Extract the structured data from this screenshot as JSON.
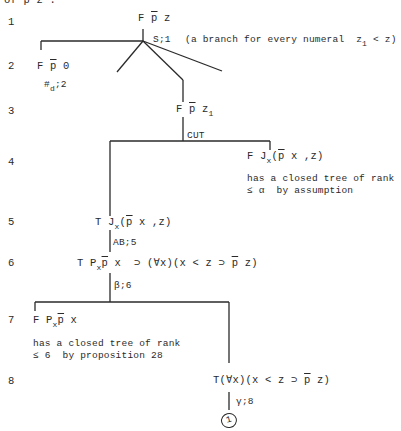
{
  "header_fragment": "of p z .",
  "line_numbers": [
    "1",
    "2",
    "3",
    "4",
    "5",
    "6",
    "7",
    "8"
  ],
  "nodes": {
    "n1": {
      "sign": "F",
      "pbar": "p",
      "rest": " z"
    },
    "rule1": "S;1",
    "rule1_note_pre": "(a branch for every numeral  z",
    "rule1_note_sub": "1",
    "rule1_note_post": " < z)",
    "n2": {
      "sign": "F ",
      "pbar": "p",
      "rest": " 0"
    },
    "rule2_pre": "#",
    "rule2_sub": "d",
    "rule2_post": ";2",
    "n3": {
      "sign": "F ",
      "pbar": "p",
      "rest": " z",
      "sub": "1"
    },
    "rule3": "CUT",
    "n4": {
      "sign": "F J",
      "sub": "x",
      "open": "(",
      "pbar": "p",
      "rest": " x ,z)"
    },
    "n4_note_1": "has a closed tree of rank",
    "n4_note_2": "≤ α  by assumption",
    "n5": {
      "sign": "T J",
      "sub": "x",
      "open": "(",
      "pbar": "p",
      "rest": " x ,z)"
    },
    "rule5": "AB;5",
    "n6": {
      "sign": "T P",
      "sub": "x",
      "pbar": "p",
      "rest": " x  ⊃ (∀x)(x < z ⊃ ",
      "pbar2": "p",
      "rest2": " z)"
    },
    "rule6": "β;6",
    "n7": {
      "sign": "F P",
      "sub": "x",
      "pbar": "p",
      "rest": " x"
    },
    "n7_note_1": "has a closed tree of rank",
    "n7_note_2": "≤ 6  by proposition 28",
    "n8": {
      "pre": "T(∀x)(x < z ⊃ ",
      "pbar": "p",
      "rest": " z)"
    },
    "rule8": "γ;8",
    "closure_mark": "1"
  }
}
